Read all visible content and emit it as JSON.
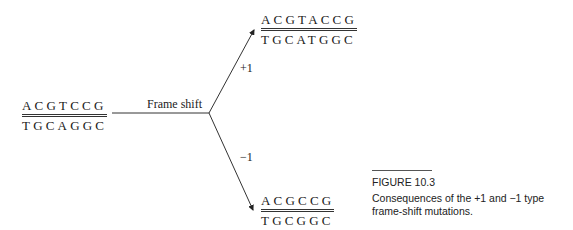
{
  "figure": {
    "original": {
      "top": "ACGTCCG",
      "bottom": "TGCAGGC"
    },
    "process_label": "Frame shift",
    "branches": [
      {
        "label": "+1",
        "top": "ACGTACCG",
        "bottom": "TGCATGGC"
      },
      {
        "label": "−1",
        "top": "ACGCCG",
        "bottom": "TGCGGC"
      }
    ],
    "caption": {
      "number": "FIGURE 10.3",
      "text": "Consequences of the +1 and −1 type frame-shift mutations."
    }
  }
}
